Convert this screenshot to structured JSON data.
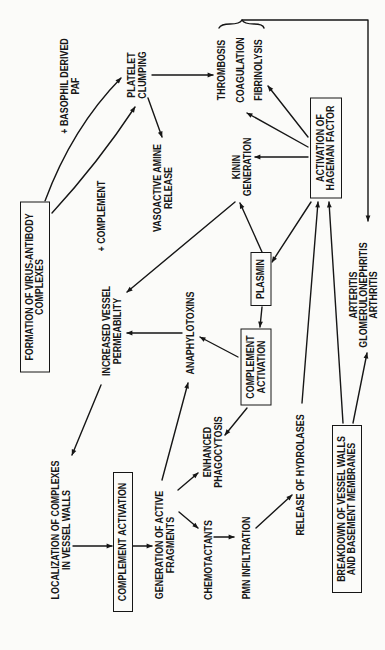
{
  "nodes": {
    "formation": {
      "lines": [
        "FORMATION OF VIRUS-ANTIBODY",
        "COMPLEXES"
      ],
      "boxed": true
    },
    "basophil": {
      "lines": [
        "+ BASOPHIL DERIVED",
        "PAF"
      ]
    },
    "platelet": {
      "lines": [
        "PLATELET",
        "CLUMPING"
      ]
    },
    "complement_plus": {
      "lines": [
        "+ COMPLEMENT"
      ]
    },
    "vasoactive": {
      "lines": [
        "VASOACTIVE AMINE",
        "RELEASE"
      ]
    },
    "outcomes_top": {
      "lines": [
        "THROMBOSIS",
        "COAGULATION",
        "FIBRINOLYSIS"
      ]
    },
    "hageman": {
      "lines": [
        "ACTIVATION OF",
        "HAGEMAN FACTOR"
      ],
      "boxed": true
    },
    "kinin": {
      "lines": [
        "KININ",
        "GENERATION"
      ]
    },
    "plasmin": {
      "lines": [
        "PLASMIN"
      ],
      "boxed": true
    },
    "complement_activation_mid": {
      "lines": [
        "COMPLEMENT",
        "ACTIVATION"
      ],
      "boxed": true
    },
    "anaphylotoxins": {
      "lines": [
        "ANAPHYLOTOXINS"
      ]
    },
    "increased_permeability": {
      "lines": [
        "INCREASED VESSEL",
        "PERMEABILITY"
      ]
    },
    "localization": {
      "lines": [
        "LOCALIZATION OF COMPLEXES",
        "IN VESSEL WALLS"
      ]
    },
    "complement_activation_low": {
      "lines": [
        "COMPLEMENT ACTIVATION"
      ],
      "boxed": true
    },
    "generation": {
      "lines": [
        "GENERATION OF ACTIVE",
        "FRAGMENTS"
      ]
    },
    "enhanced": {
      "lines": [
        "ENHANCED",
        "PHAGOCYTOSIS"
      ]
    },
    "chemotactants": {
      "lines": [
        "CHEMOTACTANTS"
      ]
    },
    "pmn": {
      "lines": [
        "PMN INFILTRATION"
      ]
    },
    "hydrolases": {
      "lines": [
        "RELEASE OF HYDROLASES"
      ]
    },
    "breakdown": {
      "lines": [
        "BREAKDOWN OF VESSEL WALLS",
        "AND BASEMENT MEMBRANES"
      ],
      "boxed": true
    },
    "diseases": {
      "lines": [
        "ARTERITIS",
        "GLOMERULONEPHRITIS",
        "ARTHRITIS"
      ]
    }
  },
  "edges": [
    {
      "from": "formation",
      "to": "platelet",
      "via": "+ BASOPHIL DERIVED PAF"
    },
    {
      "from": "formation",
      "to": "platelet",
      "via": "+ COMPLEMENT"
    },
    {
      "from": "platelet",
      "to": "outcomes_top"
    },
    {
      "from": "platelet",
      "to": "vasoactive"
    },
    {
      "from": "outcomes_top",
      "to": "diseases"
    },
    {
      "from": "hageman",
      "to": "outcomes_top",
      "target_line": "COAGULATION"
    },
    {
      "from": "hageman",
      "to": "outcomes_top",
      "target_line": "FIBRINOLYSIS"
    },
    {
      "from": "hageman",
      "to": "kinin"
    },
    {
      "from": "hageman",
      "to": "plasmin"
    },
    {
      "from": "plasmin",
      "to": "kinin"
    },
    {
      "from": "kinin",
      "to": "increased_permeability"
    },
    {
      "from": "plasmin",
      "to": "complement_activation_mid"
    },
    {
      "from": "complement_activation_mid",
      "to": "anaphylotoxins"
    },
    {
      "from": "complement_activation_mid",
      "to": "enhanced"
    },
    {
      "from": "anaphylotoxins",
      "to": "increased_permeability"
    },
    {
      "from": "increased_permeability",
      "to": "localization"
    },
    {
      "from": "localization",
      "to": "complement_activation_low"
    },
    {
      "from": "complement_activation_low",
      "to": "generation"
    },
    {
      "from": "generation",
      "to": "anaphylotoxins"
    },
    {
      "from": "generation",
      "to": "enhanced"
    },
    {
      "from": "generation",
      "to": "chemotactants"
    },
    {
      "from": "chemotactants",
      "to": "pmn"
    },
    {
      "from": "pmn",
      "to": "hydrolases"
    },
    {
      "from": "hydrolases",
      "to": "hageman"
    },
    {
      "from": "breakdown",
      "to": "hageman"
    },
    {
      "from": "breakdown",
      "to": "diseases"
    }
  ],
  "colors": {
    "ink": "#161616",
    "paper": "#fbfbf9"
  }
}
